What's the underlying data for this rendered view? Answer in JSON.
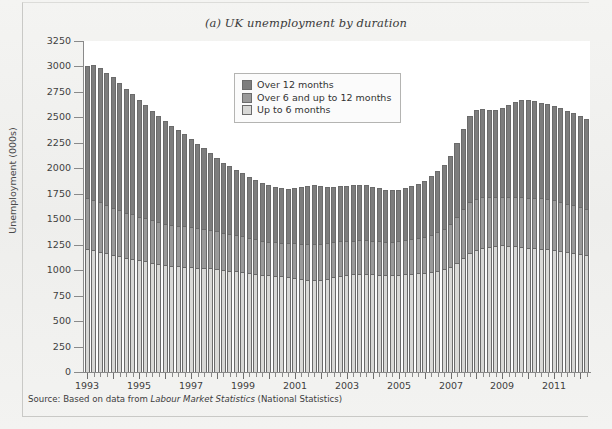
{
  "figure": {
    "title": "(a) UK unemployment by duration",
    "source_prefix": "Source: Based on data from ",
    "source_italic": "Labour Market Statistics",
    "source_suffix": " (National Statistics)"
  },
  "legend": {
    "position": "top-center-inside",
    "items": [
      {
        "label": "Over 12 months",
        "color": "#7d7d7d"
      },
      {
        "label": "Over 6 and up to 12 months",
        "color": "#9a9a9a"
      },
      {
        "label": "Up to 6 months",
        "color": "#d8d8d6"
      }
    ]
  },
  "colors": {
    "over_12_months": "#7d7d7d",
    "over_6_to_12_months": "#9a9a9a",
    "up_to_6_months": "#d8d8d6",
    "axis": "#8a8a8a",
    "bar_outline": "#6b6b6b",
    "plot_background": "#ffffff",
    "page_background": "#f2f2f0"
  },
  "chart_data": {
    "type": "bar",
    "stacked": true,
    "title": "(a) UK unemployment by duration",
    "xlabel": "",
    "ylabel": "Unemployment (000s)",
    "ylim": [
      0,
      3250
    ],
    "ytick_step": 250,
    "yticks": [
      0,
      250,
      500,
      750,
      1000,
      1250,
      1500,
      1750,
      2000,
      2250,
      2500,
      2750,
      3000,
      3250
    ],
    "grid": false,
    "legend_position": "upper center (inside plot)",
    "x_axis_note": "Quarterly observations, 1993 Q1 through 2012 Q2; labelled ticks every two years",
    "xtick_labels": [
      "1993",
      "1995",
      "1997",
      "1999",
      "2001",
      "2003",
      "2005",
      "2007",
      "2009",
      "2011"
    ],
    "xtick_label_years": [
      1993,
      1995,
      1997,
      1999,
      2001,
      2003,
      2005,
      2007,
      2009,
      2011
    ],
    "x_start_year": 1993,
    "x_end_year": 2012.25,
    "x_periods_per_year": 4,
    "n_periods": 78,
    "series": [
      {
        "name": "Up to 6 months",
        "color": "#d8d8d6",
        "stack_order": 0,
        "values": [
          1210,
          1195,
          1180,
          1165,
          1150,
          1135,
          1120,
          1110,
          1095,
          1085,
          1075,
          1060,
          1050,
          1045,
          1040,
          1035,
          1030,
          1025,
          1025,
          1020,
          1010,
          1000,
          995,
          990,
          985,
          975,
          965,
          955,
          950,
          945,
          940,
          935,
          925,
          915,
          905,
          900,
          905,
          915,
          930,
          945,
          955,
          960,
          965,
          965,
          960,
          955,
          950,
          950,
          955,
          960,
          965,
          970,
          975,
          985,
          995,
          1010,
          1035,
          1075,
          1120,
          1165,
          1195,
          1215,
          1230,
          1240,
          1245,
          1240,
          1235,
          1230,
          1220,
          1215,
          1210,
          1205,
          1200,
          1190,
          1180,
          1170,
          1160,
          1150
        ]
      },
      {
        "name": "Over 6 and up to 12 months",
        "color": "#9a9a9a",
        "stack_order": 1,
        "values": [
          500,
          495,
          485,
          475,
          465,
          455,
          445,
          440,
          430,
          425,
          415,
          410,
          405,
          400,
          395,
          395,
          390,
          385,
          380,
          375,
          370,
          365,
          360,
          355,
          350,
          345,
          340,
          335,
          330,
          330,
          330,
          335,
          340,
          345,
          350,
          355,
          355,
          350,
          345,
          340,
          335,
          330,
          330,
          330,
          330,
          330,
          330,
          330,
          330,
          335,
          340,
          345,
          350,
          360,
          375,
          395,
          420,
          450,
          480,
          500,
          505,
          500,
          490,
          480,
          475,
          475,
          480,
          485,
          490,
          495,
          495,
          490,
          485,
          480,
          470,
          465,
          460,
          455
        ]
      },
      {
        "name": "Over 12 months",
        "color": "#7d7d7d",
        "stack_order": 2,
        "values": [
          1290,
          1320,
          1320,
          1300,
          1280,
          1250,
          1215,
          1180,
          1145,
          1110,
          1075,
          1040,
          1010,
          975,
          945,
          910,
          870,
          830,
          790,
          755,
          720,
          690,
          665,
          640,
          615,
          595,
          580,
          565,
          555,
          545,
          535,
          530,
          540,
          560,
          575,
          580,
          570,
          555,
          545,
          540,
          540,
          545,
          545,
          540,
          530,
          520,
          510,
          505,
          505,
          510,
          520,
          535,
          555,
          580,
          605,
          630,
          665,
          720,
          790,
          850,
          870,
          865,
          855,
          850,
          870,
          905,
          935,
          955,
          960,
          950,
          940,
          935,
          930,
          925,
          915,
          905,
          890,
          875
        ]
      }
    ],
    "totals_note": "Stacked totals peak near 3000 in 1993 and near 2600-2650 in 2011; trough near 1400 in 2004-2005"
  }
}
